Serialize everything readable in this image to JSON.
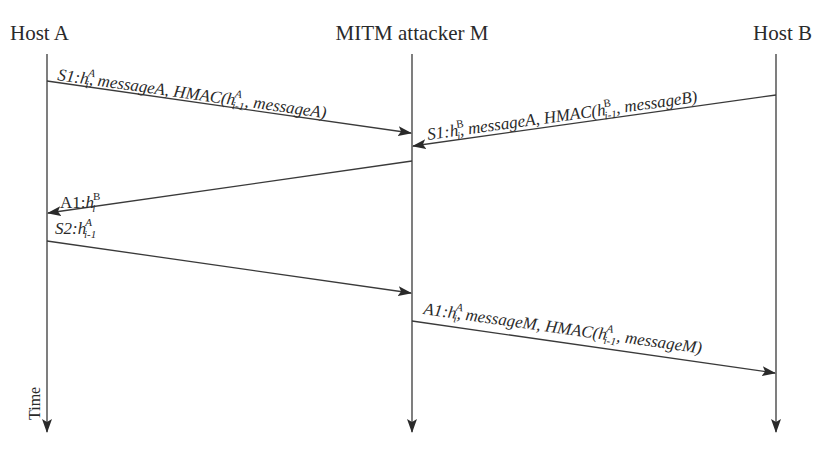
{
  "diagram": {
    "type": "sequence-diagram",
    "actors": [
      {
        "id": "A",
        "label": "Host A",
        "x": 47
      },
      {
        "id": "M",
        "label": "MITM attacker M",
        "x": 412
      },
      {
        "id": "B",
        "label": "Host B",
        "x": 776
      }
    ],
    "time_label": "Time",
    "messages": [
      {
        "from": "A",
        "to": "M",
        "y1": 81,
        "y2": 133,
        "prefix": "S1:",
        "base": "h",
        "sup": "A",
        "sub": "i",
        "rest1": ", messageA, HMAC(",
        "base2": "h",
        "sup2": "A",
        "sub2": "i-1",
        "rest2": ", messageA)"
      },
      {
        "from": "B",
        "to": "M",
        "y1": 95,
        "y2": 146,
        "prefix": "S1:",
        "base": "h",
        "sup": "B",
        "sub": "i",
        "rest1": ", messageA, HMAC(",
        "base2": "h",
        "sup2": "B",
        "sub2": "i-1",
        "rest2": ", messageB)"
      },
      {
        "from": "M",
        "to": "A",
        "y1": 161,
        "y2": 213,
        "prefix": "A1:",
        "base": "h",
        "sup": "B",
        "sub": "i"
      },
      {
        "from": "A",
        "to": "M",
        "y1": 241,
        "y2": 293,
        "prefix": "S2:",
        "base": "h",
        "sup": "A",
        "sub": "i-1"
      },
      {
        "from": "M",
        "to": "B",
        "y1": 321,
        "y2": 373,
        "prefix": "A1:",
        "base": "h",
        "sup": "A",
        "sub": "i",
        "rest1": ", messageM, HMAC(",
        "base2": "h",
        "sup2": "A",
        "sub2": "i-1",
        "rest2": ", messageM)"
      }
    ]
  }
}
